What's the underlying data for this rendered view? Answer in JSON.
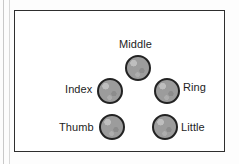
{
  "figure": {
    "background_color": "#fdfdfd",
    "frame_color": "#2e2e2e",
    "node_fill_color": "#9c9c9c",
    "node_outline_color": "#222222",
    "label_color": "#1d1d1d"
  },
  "diagram": {
    "type": "node-layout",
    "nodes": [
      {
        "id": "middle",
        "label": "Middle",
        "label_position": "above",
        "cx": 123,
        "cy": 57,
        "r": 13
      },
      {
        "id": "index",
        "label": "Index",
        "label_position": "left",
        "cx": 95,
        "cy": 80,
        "r": 13
      },
      {
        "id": "ring",
        "label": "Ring",
        "label_position": "right",
        "cx": 152,
        "cy": 80,
        "r": 13
      },
      {
        "id": "thumb",
        "label": "Thumb",
        "label_position": "left",
        "cx": 97,
        "cy": 116,
        "r": 13
      },
      {
        "id": "little",
        "label": "Little",
        "label_position": "right",
        "cx": 150,
        "cy": 116,
        "r": 13
      }
    ]
  }
}
